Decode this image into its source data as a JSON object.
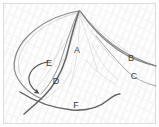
{
  "figure": {
    "background_color": "#ffffff",
    "border_color": "#d8d8d8",
    "sketch_line_color": "#7a7a7a",
    "dark_line_color": "#595959",
    "faint_line_color": "#c9c9c9",
    "label_color": "#3a3a3a",
    "hatching_color": "#f2f2f2"
  },
  "labels": [
    {
      "id": "A",
      "text": "A",
      "x": 77,
      "y": 53
    },
    {
      "id": "B",
      "text": "B",
      "x": 131,
      "y": 61
    },
    {
      "id": "C",
      "text": "C",
      "x": 134,
      "y": 79
    },
    {
      "id": "D",
      "text": "D",
      "x": 56,
      "y": 84
    },
    {
      "id": "E",
      "text": "E",
      "x": 49,
      "y": 66
    },
    {
      "id": "F",
      "text": "F",
      "x": 76,
      "y": 108
    }
  ],
  "annotations": {
    "arrow": {
      "name": "curved-arrow",
      "description": "Curved arrow sweeping counter-clockwise from upper right to lower left, tip pointing down-left at the crossing of the long dark curve",
      "tip_x": 37,
      "tip_y": 91
    }
  },
  "strokes": [
    {
      "name": "leaf-outline-left",
      "description": "Large rounded left lobe of the leaf outline running from the apex down and around to the lower left"
    },
    {
      "name": "leaf-outline-right",
      "description": "Right-hand edge of the leaf form sweeping from the apex down to the right margin"
    },
    {
      "name": "midrib-curve-d",
      "description": "Long dark curve labelled D running from the apex down through the leaf and crossing the lower left"
    },
    {
      "name": "inner-curve-e",
      "description": "Inner curve labelled E parallel to the midrib"
    },
    {
      "name": "branch-curve-b",
      "description": "Curve labelled B extending to the right edge of the frame"
    },
    {
      "name": "branch-curve-c",
      "description": "Curve labelled C descending below B toward the lower right"
    },
    {
      "name": "basal-curve-f",
      "description": "Low sweeping S-curve labelled F across the bottom of the figure"
    },
    {
      "name": "vein-fan",
      "description": "Faint fan of secondary veins radiating from the apex across the blade"
    }
  ]
}
